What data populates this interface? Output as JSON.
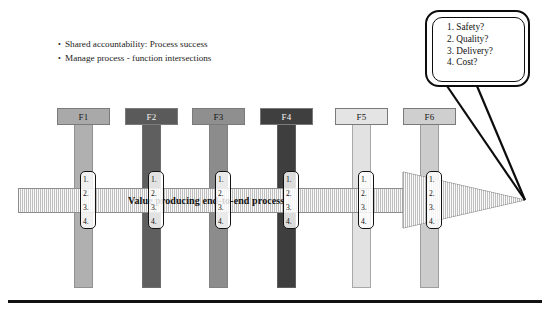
{
  "bullets": [
    {
      "marker": "•",
      "text": "Shared accountability: Process success"
    },
    {
      "marker": "•",
      "text": "Manage process - function intersections"
    }
  ],
  "columns": [
    {
      "label": "F1",
      "header_fill": "#a9a9a9",
      "stem_fill": "#b0b0b0",
      "text_color": "#1a1a1a",
      "x": 57,
      "width": 53
    },
    {
      "label": "F2",
      "header_fill": "#5a5a5a",
      "stem_fill": "#5f5f5f",
      "text_color": "#f2f2f2",
      "x": 125,
      "width": 53
    },
    {
      "label": "F3",
      "header_fill": "#8f8f8f",
      "stem_fill": "#8c8c8c",
      "text_color": "#141414",
      "x": 192,
      "width": 53
    },
    {
      "label": "F4",
      "header_fill": "#3f3f3f",
      "stem_fill": "#3e3e3e",
      "text_color": "#f5f5f5",
      "x": 260,
      "width": 53
    },
    {
      "label": "F5",
      "header_fill": "#e4e4e4",
      "stem_fill": "#e2e2e2",
      "text_color": "#151515",
      "x": 335,
      "width": 53
    },
    {
      "label": "F6",
      "header_fill": "#cfcfcf",
      "stem_fill": "#cccccc",
      "text_color": "#151515",
      "x": 403,
      "width": 53
    }
  ],
  "intersection_boxes": [
    {
      "items": [
        "1.",
        "2.",
        "3.",
        "4."
      ],
      "x": 80
    },
    {
      "items": [
        "1.",
        "2.",
        "3.",
        "4."
      ],
      "x": 148
    },
    {
      "items": [
        "1.",
        "2.",
        "3.",
        "4."
      ],
      "x": 215
    },
    {
      "items": [
        "1.",
        "2.",
        "3.",
        "4."
      ],
      "x": 283
    },
    {
      "items": [
        "1.",
        "2.",
        "3.",
        "4."
      ],
      "x": 358
    },
    {
      "items": [
        "1.",
        "2.",
        "3.",
        "4."
      ],
      "x": 426
    }
  ],
  "process_band": {
    "label": "Value producing end-to-end process",
    "fill": "#d8d8d8",
    "stroke": "#8d8d8d",
    "x": 18,
    "y": 188,
    "width": 387,
    "height": 25,
    "arrow_tip_x": 525,
    "arrow_tip_y": 200,
    "arrow_base_x": 403,
    "arrow_top_y": 172,
    "arrow_bottom_y": 228
  },
  "callout": {
    "items": [
      "1. Safety?",
      "2. Quality?",
      "3. Delivery?",
      "4. Cost?"
    ],
    "border_color": "#0c0c0c",
    "background": "#ffffff",
    "x": 425,
    "y": 10,
    "width": 105,
    "height": 77
  },
  "bottom_rule": {
    "color": "#121212"
  }
}
